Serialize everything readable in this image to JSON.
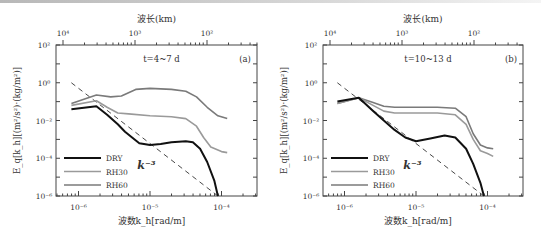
{
  "chart_data": [
    {
      "type": "line",
      "panel_label": "(a)",
      "annotation": "t=4~7 d",
      "xlabel": "波数k_h[rad/m]",
      "ylabel": "E_q[k_h][(m²/s²)·(kg/m²)]",
      "top_xlabel": "波长(km)",
      "xscale": "log",
      "yscale": "log",
      "xlim": [
        5e-07,
        0.0003
      ],
      "ylim": [
        1e-06,
        100
      ],
      "x_ticks": [
        "10⁻⁶",
        "10⁻⁵",
        "10⁻⁴"
      ],
      "y_ticks": [
        "10²",
        "10⁰",
        "10⁻²",
        "10⁻⁴",
        "10⁻⁶"
      ],
      "top_ticks": [
        "10⁴",
        "10³",
        "10²"
      ],
      "legend": [
        "DRY",
        "RH30",
        "RH60"
      ],
      "legend_position": "lower left",
      "slope_label": "k⁻³",
      "series": [
        {
          "name": "DRY",
          "color": "#111111",
          "log_k": [
            -6.1,
            -5.75,
            -5.6,
            -5.45,
            -5.35,
            -5.25,
            -5.15,
            -5.0,
            -4.85,
            -4.7,
            -4.5,
            -4.4,
            -4.3,
            -4.2,
            -4.1,
            -4.05
          ],
          "log_E": [
            -1.4,
            -1.25,
            -1.7,
            -2.2,
            -2.6,
            -2.9,
            -3.2,
            -3.3,
            -3.25,
            -3.15,
            -3.1,
            -3.15,
            -3.5,
            -4.2,
            -5.2,
            -6.0
          ]
        },
        {
          "name": "RH30",
          "color": "#9a9a9a",
          "log_k": [
            -6.1,
            -5.75,
            -5.6,
            -5.45,
            -5.3,
            -5.0,
            -4.7,
            -4.5,
            -4.35,
            -4.25,
            -4.15,
            -4.0,
            -3.92
          ],
          "log_E": [
            -1.2,
            -0.95,
            -1.3,
            -1.6,
            -1.65,
            -1.75,
            -1.8,
            -1.9,
            -2.3,
            -2.9,
            -3.4,
            -3.65,
            -3.7
          ]
        },
        {
          "name": "RH60",
          "color": "#7a7a7a",
          "log_k": [
            -6.1,
            -5.75,
            -5.55,
            -5.4,
            -5.2,
            -5.0,
            -4.7,
            -4.5,
            -4.35,
            -4.2,
            -4.05,
            -3.92
          ],
          "log_E": [
            -1.1,
            -0.65,
            -0.75,
            -0.7,
            -0.35,
            -0.3,
            -0.35,
            -0.45,
            -0.75,
            -1.3,
            -1.75,
            -1.9
          ]
        }
      ],
      "reference_line": {
        "label": "k⁻³",
        "log_k": [
          -6.1,
          -4.05
        ],
        "log_E": [
          0.0,
          -6.0
        ]
      }
    },
    {
      "type": "line",
      "panel_label": "(b)",
      "annotation": "t=10~13 d",
      "xlabel": "波数k_h[rad/m]",
      "ylabel": "E_q[k_h][(m²/s²)·(kg/m²)]",
      "top_xlabel": "波长(km)",
      "xscale": "log",
      "yscale": "log",
      "xlim": [
        5e-07,
        0.0003
      ],
      "ylim": [
        1e-06,
        100
      ],
      "x_ticks": [
        "10⁻⁶",
        "10⁻⁵",
        "10⁻⁴"
      ],
      "y_ticks": [
        "10²",
        "10⁰",
        "10⁻²",
        "10⁻⁴",
        "10⁻⁶"
      ],
      "top_ticks": [
        "10⁴",
        "10³",
        "10²"
      ],
      "legend": [
        "DRY",
        "RH30",
        "RH60"
      ],
      "legend_position": "lower left",
      "slope_label": "k⁻³",
      "series": [
        {
          "name": "DRY",
          "color": "#111111",
          "log_k": [
            -6.1,
            -5.8,
            -5.6,
            -5.45,
            -5.3,
            -5.15,
            -5.0,
            -4.8,
            -4.6,
            -4.45,
            -4.3,
            -4.2,
            -4.1,
            -4.05
          ],
          "log_E": [
            -1.0,
            -0.8,
            -1.5,
            -2.0,
            -2.5,
            -2.9,
            -3.1,
            -2.95,
            -2.8,
            -2.9,
            -3.5,
            -4.3,
            -5.3,
            -6.0
          ]
        },
        {
          "name": "RH30",
          "color": "#9a9a9a",
          "log_k": [
            -6.1,
            -5.8,
            -5.6,
            -5.45,
            -5.3,
            -5.0,
            -4.7,
            -4.45,
            -4.3,
            -4.2,
            -4.1,
            -4.0,
            -3.92
          ],
          "log_E": [
            -1.1,
            -0.8,
            -1.2,
            -1.5,
            -1.6,
            -1.6,
            -1.6,
            -1.7,
            -2.2,
            -3.0,
            -3.6,
            -3.75,
            -3.9
          ]
        },
        {
          "name": "RH60",
          "color": "#7a7a7a",
          "log_k": [
            -6.1,
            -5.8,
            -5.6,
            -5.45,
            -5.3,
            -5.0,
            -4.7,
            -4.45,
            -4.3,
            -4.2,
            -4.1,
            -4.0,
            -3.92
          ],
          "log_E": [
            -1.1,
            -0.8,
            -1.05,
            -1.25,
            -1.3,
            -1.3,
            -1.3,
            -1.35,
            -1.8,
            -2.7,
            -3.3,
            -3.45,
            -3.5
          ]
        }
      ],
      "reference_line": {
        "label": "k⁻³",
        "log_k": [
          -6.1,
          -4.05
        ],
        "log_E": [
          0.0,
          -6.0
        ]
      }
    }
  ]
}
